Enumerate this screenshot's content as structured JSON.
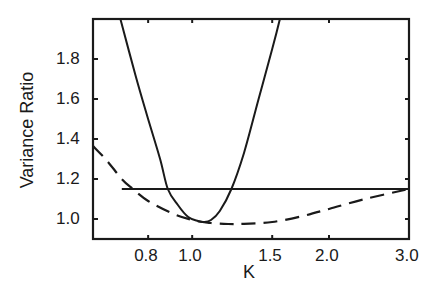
{
  "chart_data": {
    "type": "line",
    "title": "",
    "xlabel": "K",
    "ylabel": "Variance Ratio",
    "xscale": "log",
    "xlim": [
      0.605,
      3.0
    ],
    "ylim": [
      0.9,
      2.0
    ],
    "xticks": [
      0.8,
      1.0,
      1.5,
      2.0,
      3.0
    ],
    "xtick_labels": [
      "0.8",
      "1.0",
      "1.5",
      "2.0",
      "3.0"
    ],
    "yticks": [
      1.0,
      1.2,
      1.4,
      1.6,
      1.8
    ],
    "ytick_labels": [
      "1.0",
      "1.2",
      "1.4",
      "1.6",
      "1.8"
    ],
    "grid": false,
    "legend": null,
    "series": [
      {
        "name": "solid curve",
        "style": "solid",
        "x": [
          0.695,
          0.75,
          0.8,
          0.85,
          0.884,
          0.93,
          0.98,
          1.03,
          1.06,
          1.1,
          1.15,
          1.22,
          1.3,
          1.4,
          1.5,
          1.56
        ],
        "y": [
          2.0,
          1.72,
          1.5,
          1.3,
          1.15,
          1.07,
          1.01,
          0.99,
          0.985,
          0.995,
          1.04,
          1.15,
          1.33,
          1.6,
          1.85,
          2.0
        ]
      },
      {
        "name": "dashed curve",
        "style": "dashed",
        "x": [
          0.605,
          0.65,
          0.7,
          0.74,
          0.8,
          0.9,
          1.0,
          1.1,
          1.2,
          1.3,
          1.5,
          1.75,
          2.0,
          2.4,
          3.0
        ],
        "y": [
          1.365,
          1.29,
          1.2,
          1.15,
          1.09,
          1.03,
          0.995,
          0.98,
          0.975,
          0.976,
          0.985,
          1.015,
          1.05,
          1.1,
          1.15
        ]
      },
      {
        "name": "horizontal reference line",
        "style": "solid",
        "x": [
          0.7,
          3.0
        ],
        "y": [
          1.15,
          1.15
        ]
      }
    ]
  }
}
